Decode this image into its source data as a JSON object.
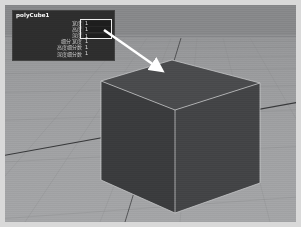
{
  "app": {
    "name": "3d-modeling-viewport",
    "view_label": "persp"
  },
  "channel_box": {
    "title": "polyCube1",
    "rows": [
      {
        "label": "宽度",
        "value": "1",
        "field": true,
        "highlighted": true
      },
      {
        "label": "高度",
        "value": "1",
        "field": true,
        "highlighted": true
      },
      {
        "label": "深度",
        "value": "1",
        "field": true,
        "highlighted": true
      },
      {
        "label": "细分 宽度",
        "value": "1",
        "field": false,
        "highlighted": false
      },
      {
        "label": "高度细分数",
        "value": "1",
        "field": false,
        "highlighted": false
      },
      {
        "label": "深度细分数",
        "value": "1",
        "field": false,
        "highlighted": false
      }
    ]
  },
  "annotation": {
    "highlight_label": "highlight-width-height-depth",
    "arrow_label": "arrow-pointing-to-cube",
    "arrow_color": "#ffffff",
    "highlight_color": "#eeeeee"
  },
  "scene": {
    "object_name": "pCube1",
    "cube_fill_top": "#4a4b4d",
    "cube_fill_left": "#3c3d3f",
    "cube_fill_right": "#434446",
    "cube_edge_color": "#c9cacc",
    "ground_color": "#a0a1a3",
    "sky_color": "#87888a",
    "grid_line_color": "#8a8b8d",
    "axis_line_color": "#2c2d2f"
  }
}
